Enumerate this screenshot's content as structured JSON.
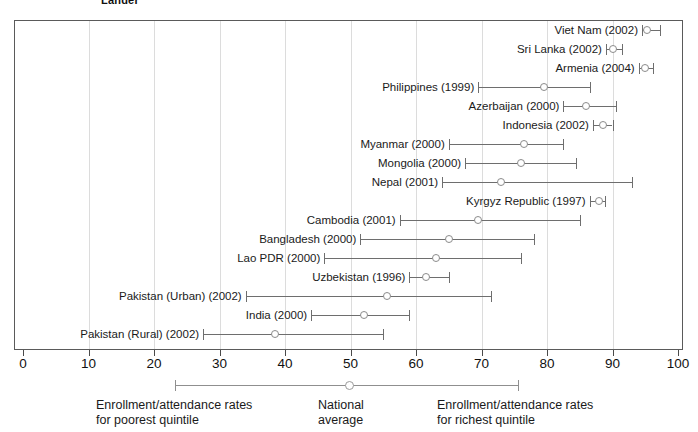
{
  "title_fragment": "Lander",
  "chart_data": {
    "type": "scatter",
    "title": "",
    "xlabel": "",
    "ylabel": "",
    "xlim": [
      0,
      100
    ],
    "grid": true,
    "legend_position": "bottom",
    "x_ticks": [
      0,
      10,
      20,
      30,
      40,
      50,
      60,
      70,
      80,
      90,
      100
    ],
    "x_tick_labels": [
      "0",
      "10",
      "20",
      "30",
      "40",
      "50",
      "60",
      "70",
      "80",
      "90",
      "100"
    ],
    "series_names": [
      "poorest quintile",
      "national average",
      "richest quintile"
    ],
    "categories": [
      "Viet Nam (2002)",
      "Sri Lanka (2002)",
      "Armenia (2004)",
      "Philippines (1999)",
      "Azerbaijan (2000)",
      "Indonesia (2002)",
      "Myanmar (2000)",
      "Mongolia (2000)",
      "Nepal (2001)",
      "Kyrgyz Republic (1997)",
      "Cambodia (2001)",
      "Bangladesh (2000)",
      "Lao PDR (2000)",
      "Uzbekistan (1996)",
      "Pakistan (Urban) (2002)",
      "India (2000)",
      "Pakistan (Rural) (2002)"
    ],
    "rows": [
      {
        "label": "Viet Nam (2002)",
        "poorest": 94.5,
        "average": 95.2,
        "richest": 97.2
      },
      {
        "label": "Sri Lanka (2002)",
        "poorest": 89.0,
        "average": 90.0,
        "richest": 91.5
      },
      {
        "label": "Armenia (2004)",
        "poorest": 94.0,
        "average": 95.0,
        "richest": 96.2
      },
      {
        "label": "Philippines (1999)",
        "poorest": 69.5,
        "average": 79.5,
        "richest": 86.5
      },
      {
        "label": "Azerbaijan (2000)",
        "poorest": 82.5,
        "average": 86.0,
        "richest": 90.5
      },
      {
        "label": "Indonesia (2002)",
        "poorest": 87.0,
        "average": 88.5,
        "richest": 90.0
      },
      {
        "label": "Myanmar (2000)",
        "poorest": 65.0,
        "average": 76.5,
        "richest": 82.5
      },
      {
        "label": "Mongolia (2000)",
        "poorest": 67.5,
        "average": 76.0,
        "richest": 84.5
      },
      {
        "label": "Nepal (2001)",
        "poorest": 64.0,
        "average": 73.0,
        "richest": 93.0
      },
      {
        "label": "Kyrgyz Republic (1997)",
        "poorest": 86.5,
        "average": 88.0,
        "richest": 88.8
      },
      {
        "label": "Cambodia (2001)",
        "poorest": 57.5,
        "average": 69.5,
        "richest": 85.0
      },
      {
        "label": "Bangladesh (2000)",
        "poorest": 51.5,
        "average": 65.0,
        "richest": 78.0
      },
      {
        "label": "Lao PDR (2000)",
        "poorest": 46.0,
        "average": 63.0,
        "richest": 76.0
      },
      {
        "label": "Uzbekistan (1996)",
        "poorest": 59.0,
        "average": 61.5,
        "richest": 65.0
      },
      {
        "label": "Pakistan (Urban) (2002)",
        "poorest": 34.0,
        "average": 55.5,
        "richest": 71.5
      },
      {
        "label": "India (2000)",
        "poorest": 44.0,
        "average": 52.0,
        "richest": 59.0
      },
      {
        "label": "Pakistan (Rural) (2002)",
        "poorest": 27.5,
        "average": 38.5,
        "richest": 55.0
      }
    ]
  },
  "legend": {
    "poorest_label": "Enrollment/attendance rates\nfor poorest quintile",
    "national_label": "National\naverage",
    "richest_label": "Enrollment/attendance rates\nfor richest quintile"
  },
  "colors": {
    "frame": "#5a5a5a",
    "grid": "#dcdcdc",
    "whisker": "#6e6e6e",
    "marker_stroke": "#8b8b8b",
    "text": "#1a1a1a"
  }
}
